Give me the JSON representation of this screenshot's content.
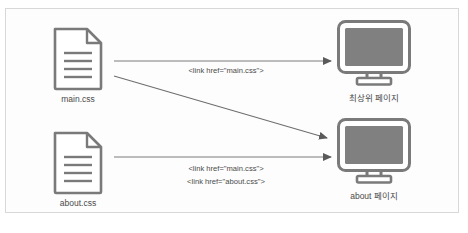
{
  "diagram": {
    "colors": {
      "icon_outline": "#7a7a7a",
      "screen_fill": "#808080",
      "arrow": "#5a5a5a",
      "text": "#4a4a4a",
      "border": "#d8d8d8",
      "background": "#ffffff"
    },
    "sources": [
      {
        "id": "main-css",
        "icon": "document-icon",
        "label": "main.css",
        "lines": 4
      },
      {
        "id": "about-css",
        "icon": "document-icon",
        "label": "about.css",
        "lines": 4
      }
    ],
    "targets": [
      {
        "id": "top-page",
        "icon": "monitor-icon",
        "label": "최상위 페이지"
      },
      {
        "id": "about-page",
        "icon": "monitor-icon",
        "label": "about 페이지"
      }
    ],
    "edges": [
      {
        "id": "main-to-top",
        "from": "main-css",
        "to": "top-page",
        "label_lines": [
          "<link href=\"main.css\">"
        ]
      },
      {
        "id": "main-to-about",
        "from": "main-css",
        "to": "about-page",
        "label_lines": []
      },
      {
        "id": "about-to-about",
        "from": "about-css",
        "to": "about-page",
        "label_lines": [
          "<link href=\"main.css\">",
          "<link href=\"about.css\">"
        ]
      }
    ],
    "edge_labels": {
      "top": "<link href=\"main.css\">",
      "bottom_line1": "<link href=\"main.css\">",
      "bottom_line2": "<link href=\"about.css\">"
    }
  }
}
